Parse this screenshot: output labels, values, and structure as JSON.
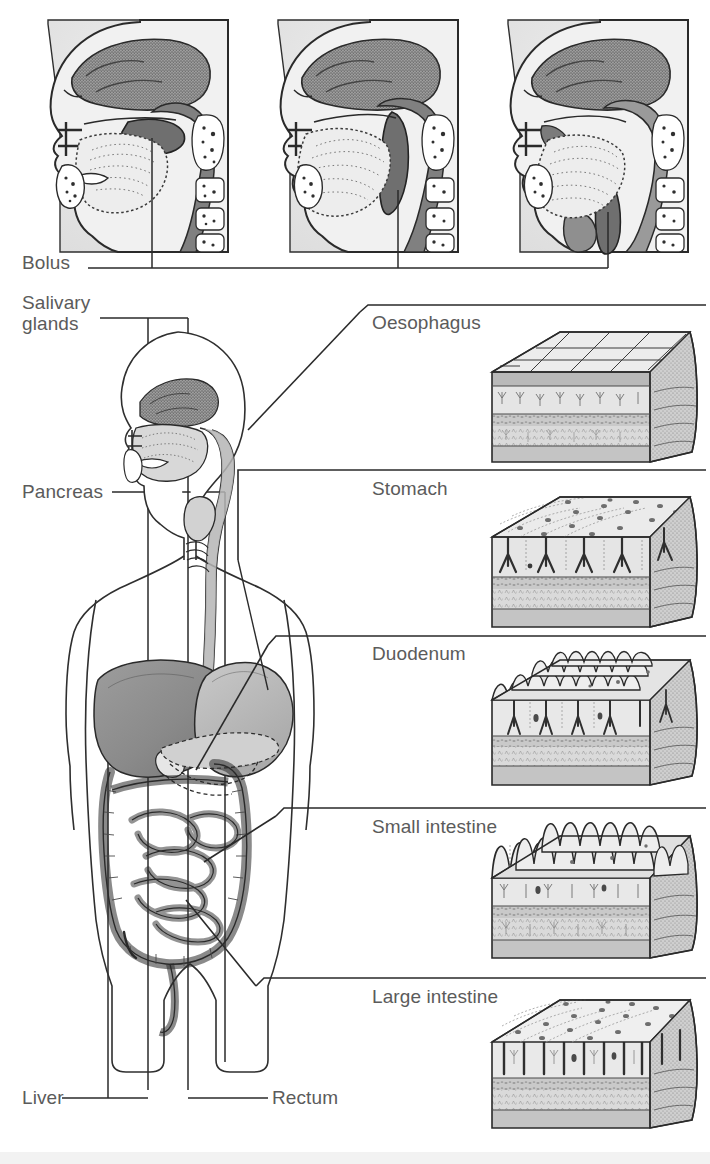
{
  "figure": {
    "background_color": "#ffffff",
    "label_color": "#5b5b5b",
    "line_color": "#3a3a3a"
  },
  "swallowing_panels": [
    {
      "id": "stage-1",
      "name": "sagittal-head-bolus-in-mouth",
      "pointer_label": "Bolus",
      "frame": {
        "x": 48,
        "y": 18,
        "w": 182,
        "h": 236
      }
    },
    {
      "id": "stage-2",
      "name": "sagittal-head-bolus-in-pharynx",
      "pointer_label": "Bolus",
      "frame": {
        "x": 278,
        "y": 18,
        "w": 182,
        "h": 236
      }
    },
    {
      "id": "stage-3",
      "name": "sagittal-head-bolus-in-oesophagus",
      "pointer_label": "Bolus",
      "frame": {
        "x": 508,
        "y": 18,
        "w": 182,
        "h": 236
      }
    }
  ],
  "left_labels": [
    {
      "text": "Bolus",
      "x": 22,
      "y": 253,
      "two_line": false
    },
    {
      "text": "Salivary\nglands",
      "x": 22,
      "y": 295,
      "two_line": true,
      "line1": "Salivary",
      "line2": "glands"
    },
    {
      "text": "Pancreas",
      "x": 22,
      "y": 480,
      "two_line": false
    },
    {
      "text": "Liver",
      "x": 22,
      "y": 1087,
      "two_line": false
    },
    {
      "text": "Rectum",
      "x": 272,
      "y": 1087,
      "two_line": false
    }
  ],
  "left_label_parts": {
    "bolus": "Bolus",
    "salivary_line1": "Salivary",
    "salivary_line2": "glands",
    "pancreas": "Pancreas",
    "liver": "Liver",
    "rectum": "Rectum"
  },
  "tissue_panels": [
    {
      "label": "Oesophagus",
      "label_x": 372,
      "label_y": 318,
      "divider_y": 305,
      "divider_x1": 368,
      "divider_x2": 706,
      "block": {
        "x": 488,
        "y": 330,
        "w": 200,
        "h": 135
      },
      "epithelium": "stratified-squamous",
      "surface": "flat-tiled"
    },
    {
      "label": "Stomach",
      "label_x": 372,
      "label_y": 484,
      "divider_y": 470,
      "divider_x1": 238,
      "divider_x2": 706,
      "block": {
        "x": 488,
        "y": 495,
        "w": 200,
        "h": 135
      },
      "epithelium": "simple-columnar-with-gastric-pits",
      "surface": "pitted-cells"
    },
    {
      "label": "Duodenum",
      "label_x": 372,
      "label_y": 650,
      "divider_y": 636,
      "divider_x1": 188,
      "divider_x2": 706,
      "block": {
        "x": 488,
        "y": 645,
        "w": 200,
        "h": 140
      },
      "epithelium": "villi-short",
      "surface": "low-villi"
    },
    {
      "label": "Small intestine",
      "label_x": 372,
      "label_y": 823,
      "divider_y": 808,
      "divider_x1": 188,
      "divider_x2": 706,
      "block": {
        "x": 488,
        "y": 815,
        "w": 200,
        "h": 145
      },
      "epithelium": "villi-tall",
      "surface": "tall-villi"
    },
    {
      "label": "Large intestine",
      "label_x": 372,
      "label_y": 993,
      "divider_y": 978,
      "divider_x1": 258,
      "divider_x2": 706,
      "block": {
        "x": 488,
        "y": 995,
        "w": 200,
        "h": 135
      },
      "epithelium": "simple-columnar-with-crypts",
      "surface": "flat-cells-with-crypts"
    }
  ],
  "body_figure": {
    "name": "human-torso-outline",
    "organs": [
      "oral-cavity",
      "tongue",
      "salivary-glands",
      "pharynx",
      "oesophagus",
      "stomach",
      "liver",
      "gallbladder",
      "pancreas",
      "duodenum",
      "small-intestine",
      "large-intestine",
      "caecum",
      "appendix",
      "rectum"
    ]
  },
  "colors": {
    "tissue_light": "#e3e3e3",
    "tissue_mid": "#c2c2c2",
    "tissue_dark": "#9a9a9a",
    "organ_fill": "#b9b9b9",
    "organ_dark": "#8d8d8d",
    "outline": "#333333",
    "panel_bg": "#e8e8e8"
  }
}
